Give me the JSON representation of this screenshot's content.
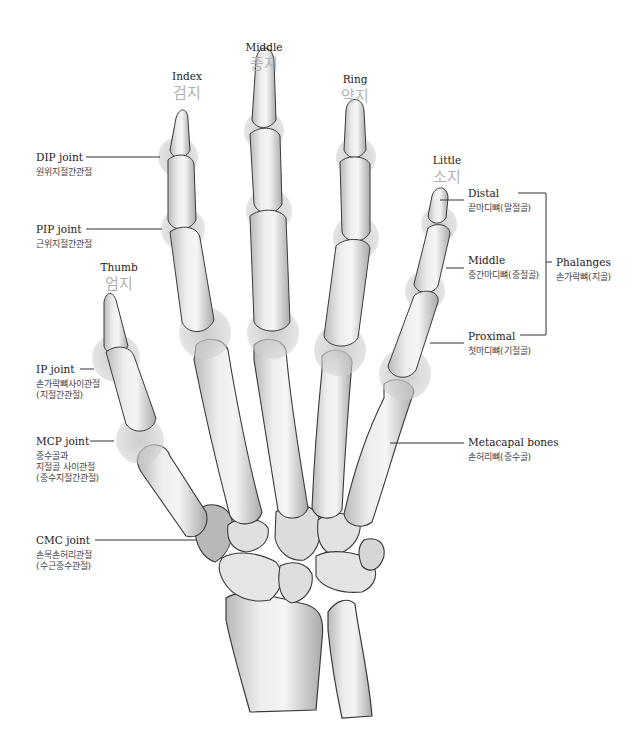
{
  "fingers": {
    "thumb": {
      "en": "Thumb",
      "ko": "엄지"
    },
    "index": {
      "en": "Index",
      "ko": "검지"
    },
    "middle": {
      "en": "Middle",
      "ko": "중지"
    },
    "ring": {
      "en": "Ring",
      "ko": "약지"
    },
    "little": {
      "en": "Little",
      "ko": "소지"
    }
  },
  "joints": {
    "dip": {
      "en": "DIP joint",
      "ko": "원위지절간관절"
    },
    "pip": {
      "en": "PIP joint",
      "ko": "근위지절간관절"
    },
    "ip": {
      "en": "IP joint",
      "ko": "손가락뼈사이관절\n(지절간관절)"
    },
    "mcp": {
      "en": "MCP joint",
      "ko": "중수골과\n지절골 사이관절\n(중수지절간관절)"
    },
    "cmc": {
      "en": "CMC joint",
      "ko": "손목손허리관절\n(수근중수관절)"
    }
  },
  "bones": {
    "distal": {
      "en": "Distal",
      "ko": "끝마디뼈(말절골)"
    },
    "middle": {
      "en": "Middle",
      "ko": "중간마디뼈(중절골)"
    },
    "proximal": {
      "en": "Proximal",
      "ko": "첫마디뼈(기절골)"
    },
    "phalanges": {
      "en": "Phalanges",
      "ko": "손가락뼈(지골)"
    },
    "metacarpal": {
      "en": "Metacapal bones",
      "ko": "손허리뼈(중수골)"
    }
  },
  "colors": {
    "bone_fill": "#e4e4e4",
    "bone_outline": "#3a3a3a",
    "joint_highlight": "#c4c4c4",
    "korean_finger_label": "#b2b2b2",
    "leader_line": "#333333"
  }
}
